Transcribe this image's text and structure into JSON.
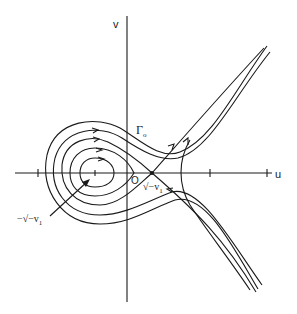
{
  "diagram": {
    "type": "phase-portrait",
    "axes": {
      "horizontal_label": "u",
      "vertical_label": "v",
      "origin_label": "O"
    },
    "labels": {
      "separatrix": "Γ",
      "separatrix_subscript": "o",
      "saddle_point": "√−v",
      "saddle_point_subscript": "1",
      "center_point": "−√−v",
      "center_point_subscript": "1"
    },
    "critical_points": [
      {
        "name": "center",
        "label": "-sqrt(-v1)",
        "position": "negative u-axis"
      },
      {
        "name": "saddle",
        "label": "sqrt(-v1)",
        "position": "positive u-axis"
      }
    ],
    "colors": {
      "ink": "#1a1a1a",
      "background": "#ffffff"
    }
  }
}
